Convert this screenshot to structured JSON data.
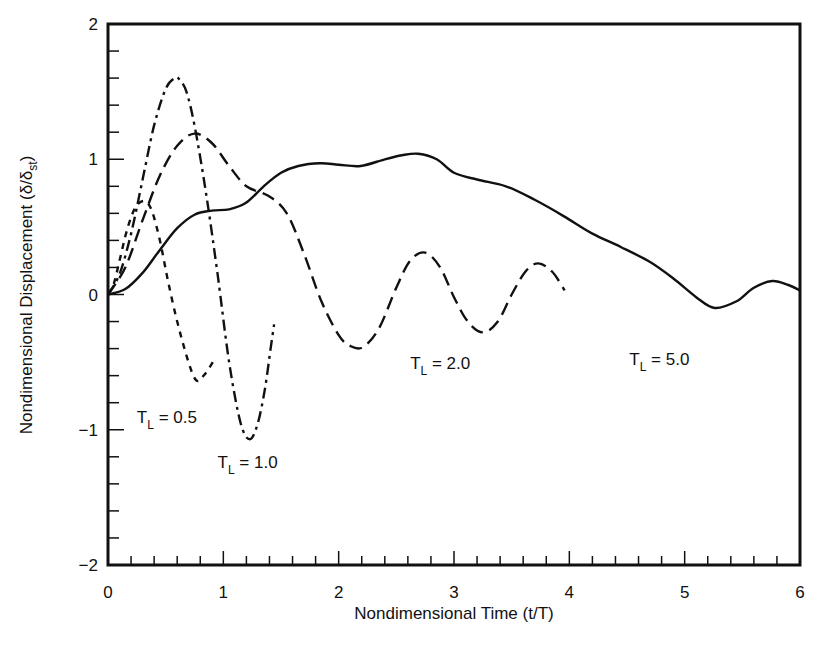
{
  "chart_data": {
    "type": "line",
    "title": "",
    "xlabel": "Nondimensional Time (t/T)",
    "ylabel": "Nondimensional Displacement (δ/δst)",
    "ylabel_parts": {
      "main": "Nondimensional Displacement (δ/δ",
      "sub": "st",
      "close": ")"
    },
    "xlim": [
      0,
      6
    ],
    "ylim": [
      -2,
      2
    ],
    "xticks": [
      0,
      1,
      2,
      3,
      4,
      5,
      6
    ],
    "xtick_labels": [
      "0",
      "1",
      "2",
      "3",
      "4",
      "5",
      "6"
    ],
    "yticks": [
      -2,
      -1,
      0,
      1,
      2
    ],
    "ytick_labels": [
      "−2",
      "−1",
      "0",
      "1",
      "2"
    ],
    "x_minor_step": 0.2,
    "y_minor_step": 0.2,
    "grid": false,
    "legend": "inline labels",
    "series": [
      {
        "name": "TL = 0.5",
        "label_main": "T",
        "label_sub": "L",
        "label_value": " = 0.5",
        "line_style": "short-dash",
        "label_pos": [
          0.25,
          -0.95
        ],
        "x": [
          0,
          0.05,
          0.1,
          0.15,
          0.2,
          0.25,
          0.32,
          0.38,
          0.45,
          0.52,
          0.6,
          0.68,
          0.74,
          0.78,
          0.83,
          0.88,
          0.93
        ],
        "y": [
          0,
          0.08,
          0.25,
          0.43,
          0.57,
          0.66,
          0.69,
          0.62,
          0.4,
          0.1,
          -0.2,
          -0.45,
          -0.6,
          -0.64,
          -0.6,
          -0.54,
          -0.47
        ]
      },
      {
        "name": "TL = 1.0",
        "label_main": "T",
        "label_sub": "L",
        "label_value": " = 1.0",
        "line_style": "dash-dot",
        "label_pos": [
          0.95,
          -1.28
        ],
        "x": [
          0,
          0.1,
          0.2,
          0.3,
          0.4,
          0.5,
          0.58,
          0.62,
          0.68,
          0.75,
          0.85,
          0.95,
          1.05,
          1.15,
          1.23,
          1.3,
          1.36,
          1.41,
          1.44
        ],
        "y": [
          0,
          0.15,
          0.45,
          0.85,
          1.25,
          1.52,
          1.6,
          1.59,
          1.5,
          1.25,
          0.75,
          0.15,
          -0.5,
          -0.95,
          -1.07,
          -0.95,
          -0.7,
          -0.4,
          -0.22
        ]
      },
      {
        "name": "TL = 2.0",
        "label_main": "T",
        "label_sub": "L",
        "label_value": " = 2.0",
        "line_style": "long-dash",
        "label_pos": [
          2.62,
          -0.55
        ],
        "x": [
          0,
          0.15,
          0.3,
          0.45,
          0.6,
          0.75,
          0.9,
          1.05,
          1.2,
          1.39,
          1.55,
          1.7,
          1.85,
          2.0,
          2.1,
          2.21,
          2.35,
          2.5,
          2.62,
          2.75,
          2.88,
          3.0,
          3.12,
          3.25,
          3.38,
          3.5,
          3.62,
          3.73,
          3.85,
          3.96
        ],
        "y": [
          0,
          0.2,
          0.55,
          0.88,
          1.1,
          1.19,
          1.12,
          0.95,
          0.8,
          0.73,
          0.6,
          0.3,
          -0.05,
          -0.3,
          -0.38,
          -0.39,
          -0.25,
          0.05,
          0.25,
          0.31,
          0.2,
          -0.02,
          -0.2,
          -0.28,
          -0.2,
          0.0,
          0.17,
          0.23,
          0.17,
          0.03
        ]
      },
      {
        "name": "TL = 5.0",
        "label_main": "T",
        "label_sub": "L",
        "label_value": " = 5.0",
        "line_style": "solid",
        "label_pos": [
          4.52,
          -0.52
        ],
        "x": [
          0,
          0.15,
          0.3,
          0.45,
          0.6,
          0.75,
          0.9,
          1.05,
          1.2,
          1.35,
          1.5,
          1.65,
          1.84,
          2.0,
          2.19,
          2.4,
          2.55,
          2.69,
          2.85,
          3.0,
          3.2,
          3.45,
          3.7,
          3.95,
          4.2,
          4.45,
          4.7,
          4.9,
          5.1,
          5.26,
          5.45,
          5.6,
          5.76,
          5.9,
          6.0
        ],
        "y": [
          0,
          0.04,
          0.16,
          0.33,
          0.49,
          0.59,
          0.62,
          0.63,
          0.68,
          0.8,
          0.9,
          0.95,
          0.97,
          0.96,
          0.95,
          1.0,
          1.03,
          1.04,
          1.0,
          0.9,
          0.85,
          0.8,
          0.7,
          0.58,
          0.45,
          0.35,
          0.24,
          0.12,
          -0.02,
          -0.1,
          -0.05,
          0.05,
          0.1,
          0.07,
          0.03
        ]
      }
    ]
  }
}
